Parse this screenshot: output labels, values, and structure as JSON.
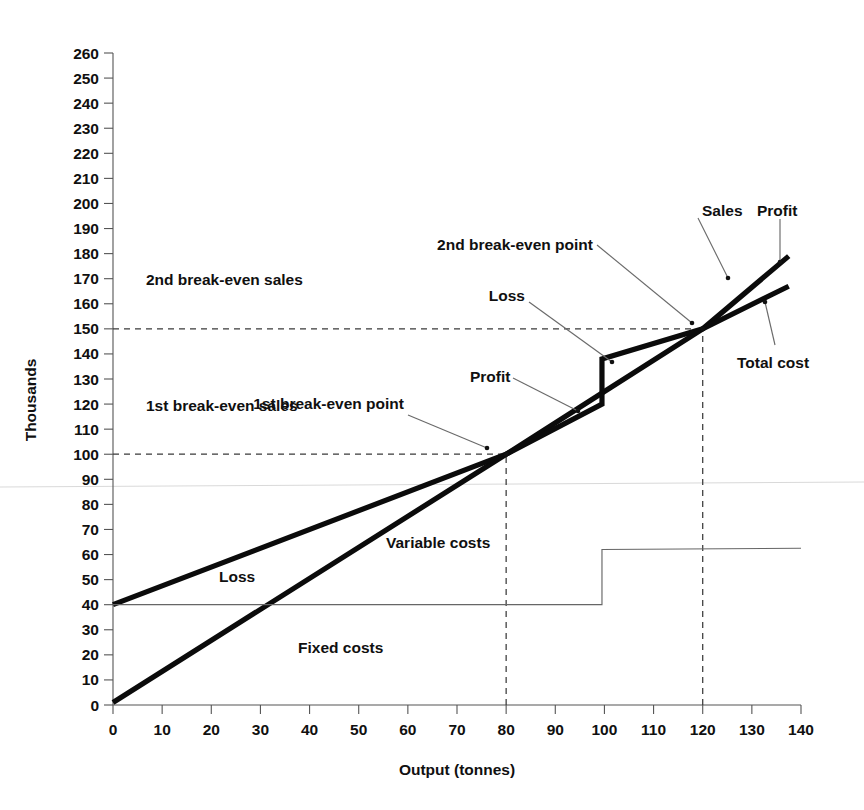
{
  "chart_data": {
    "type": "line",
    "title": "",
    "xlabel": "Output (tonnes)",
    "ylabel": "Thousands",
    "xlim": [
      0,
      140
    ],
    "ylim": [
      0,
      260
    ],
    "xticks": [
      0,
      10,
      20,
      30,
      40,
      50,
      60,
      70,
      80,
      90,
      100,
      110,
      120,
      130,
      140
    ],
    "yticks": [
      0,
      10,
      20,
      30,
      40,
      50,
      60,
      70,
      80,
      90,
      100,
      110,
      120,
      130,
      140,
      150,
      160,
      170,
      180,
      190,
      200,
      210,
      220,
      230,
      240,
      250,
      260
    ],
    "grid": false,
    "legend": "none",
    "series": [
      {
        "name": "Sales",
        "style": "thick",
        "points": [
          [
            0,
            1
          ],
          [
            80,
            100
          ],
          [
            100,
            125
          ],
          [
            120,
            150
          ],
          [
            137.5,
            179
          ]
        ]
      },
      {
        "name": "Total cost",
        "style": "thick",
        "points": [
          [
            0,
            40
          ],
          [
            80,
            100
          ],
          [
            99.5,
            120
          ],
          [
            99.5,
            138
          ],
          [
            120,
            150
          ],
          [
            137.5,
            167
          ]
        ]
      },
      {
        "name": "Fixed costs",
        "style": "thin",
        "points": [
          [
            0,
            40
          ],
          [
            99.5,
            40
          ],
          [
            99.5,
            62
          ],
          [
            140,
            62.5
          ]
        ]
      }
    ],
    "guides": [
      {
        "name": "1st break-even sales level",
        "type": "horizontal",
        "value": 100,
        "from_x": 0,
        "to_x": 80
      },
      {
        "name": "2nd break-even sales level",
        "type": "horizontal",
        "value": 150,
        "from_x": 0,
        "to_x": 120
      },
      {
        "name": "1st break-even output",
        "type": "vertical",
        "value": 80,
        "from_y": 0,
        "to_y": 100
      },
      {
        "name": "2nd break-even output",
        "type": "vertical",
        "value": 120,
        "from_y": 0,
        "to_y": 150
      }
    ],
    "break_even_points": [
      {
        "label": "1st break-even point",
        "output": 80,
        "value": 100
      },
      {
        "label": "2nd break-even point",
        "output": 120,
        "value": 150
      }
    ]
  },
  "annotations": {
    "second_break_even_sales": "2nd break-even sales",
    "first_break_even_sales": "1st break-even sales",
    "first_break_even_point": "1st break-even point",
    "second_break_even_point": "2nd break-even point",
    "loss_upper": "Loss",
    "loss_lower": "Loss",
    "profit_mid": "Profit",
    "profit_right": "Profit",
    "sales": "Sales",
    "total_cost": "Total cost",
    "variable_costs": "Variable costs",
    "fixed_costs": "Fixed costs"
  },
  "axes": {
    "x_title": "Output (tonnes)",
    "y_title": "Thousands",
    "x_tick_labels": [
      "0",
      "10",
      "20",
      "30",
      "40",
      "50",
      "60",
      "70",
      "80",
      "90",
      "100",
      "110",
      "120",
      "130",
      "140"
    ],
    "y_tick_labels": [
      "0",
      "10",
      "20",
      "30",
      "40",
      "50",
      "60",
      "70",
      "80",
      "90",
      "100",
      "110",
      "120",
      "130",
      "140",
      "150",
      "160",
      "170",
      "180",
      "190",
      "200",
      "210",
      "220",
      "230",
      "240",
      "250",
      "260"
    ]
  },
  "colors": {
    "series_main": "#0b0b0b",
    "series_light": "#666666",
    "axis": "#555555",
    "guide": "#3a3a3a",
    "background": "#ffffff"
  }
}
